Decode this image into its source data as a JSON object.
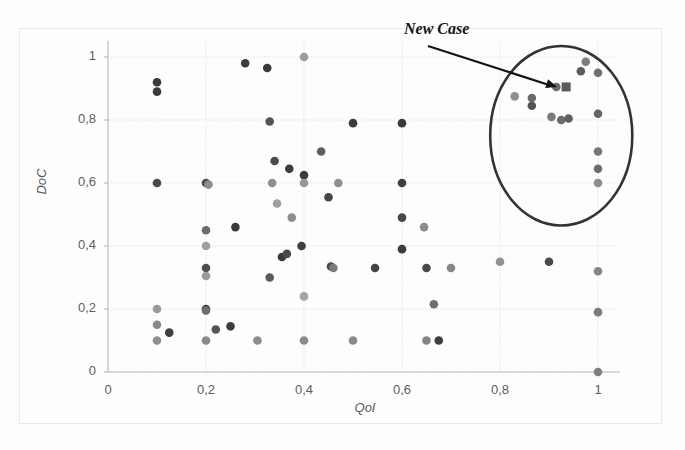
{
  "chart_data": {
    "type": "scatter",
    "title": "",
    "xlabel": "QoI",
    "ylabel": "DoC",
    "xlim": [
      0,
      1.05
    ],
    "ylim": [
      0,
      1.05
    ],
    "grid": true,
    "legend": "none",
    "xtick_labels": [
      "0",
      "0,2",
      "0,4",
      "0,6",
      "0,8",
      "1"
    ],
    "xtick_values": [
      0,
      0.2,
      0.4,
      0.6,
      0.8,
      1
    ],
    "ytick_labels": [
      "0",
      "0,2",
      "0,4",
      "0,6",
      "0,8",
      "1"
    ],
    "ytick_values": [
      0,
      0.2,
      0.4,
      0.6,
      0.8,
      1
    ],
    "series": [
      {
        "name": "past cases",
        "marker": "circle",
        "points": [
          {
            "x": 0.1,
            "y": 0.92,
            "shade": "#3a3a3a"
          },
          {
            "x": 0.1,
            "y": 0.89,
            "shade": "#3a3a3a"
          },
          {
            "x": 0.1,
            "y": 0.6,
            "shade": "#4a4a4a"
          },
          {
            "x": 0.1,
            "y": 0.2,
            "shade": "#9a9a9a"
          },
          {
            "x": 0.1,
            "y": 0.15,
            "shade": "#8a8a8a"
          },
          {
            "x": 0.1,
            "y": 0.1,
            "shade": "#8f8f8f"
          },
          {
            "x": 0.125,
            "y": 0.125,
            "shade": "#3f3f3f"
          },
          {
            "x": 0.2,
            "y": 0.6,
            "shade": "#4c4c4c"
          },
          {
            "x": 0.205,
            "y": 0.595,
            "shade": "#8d8d8d"
          },
          {
            "x": 0.2,
            "y": 0.45,
            "shade": "#6d6d6d"
          },
          {
            "x": 0.2,
            "y": 0.4,
            "shade": "#9e9e9e"
          },
          {
            "x": 0.2,
            "y": 0.33,
            "shade": "#4f4f4f"
          },
          {
            "x": 0.2,
            "y": 0.305,
            "shade": "#9b9b9b"
          },
          {
            "x": 0.2,
            "y": 0.2,
            "shade": "#3c3c3c"
          },
          {
            "x": 0.2,
            "y": 0.195,
            "shade": "#6e6e6e"
          },
          {
            "x": 0.2,
            "y": 0.1,
            "shade": "#8a8a8a"
          },
          {
            "x": 0.22,
            "y": 0.135,
            "shade": "#545454"
          },
          {
            "x": 0.25,
            "y": 0.145,
            "shade": "#3d3d3d"
          },
          {
            "x": 0.26,
            "y": 0.46,
            "shade": "#3a3a3a"
          },
          {
            "x": 0.28,
            "y": 0.98,
            "shade": "#3c3c3c"
          },
          {
            "x": 0.305,
            "y": 0.1,
            "shade": "#8c8c8c"
          },
          {
            "x": 0.325,
            "y": 0.965,
            "shade": "#3a3a3a"
          },
          {
            "x": 0.33,
            "y": 0.3,
            "shade": "#5a5a5a"
          },
          {
            "x": 0.33,
            "y": 0.795,
            "shade": "#545454"
          },
          {
            "x": 0.335,
            "y": 0.6,
            "shade": "#8f8f8f"
          },
          {
            "x": 0.34,
            "y": 0.67,
            "shade": "#4a4a4a"
          },
          {
            "x": 0.345,
            "y": 0.535,
            "shade": "#a0a0a0"
          },
          {
            "x": 0.355,
            "y": 0.365,
            "shade": "#3a3a3a"
          },
          {
            "x": 0.365,
            "y": 0.375,
            "shade": "#4b4b4b"
          },
          {
            "x": 0.37,
            "y": 0.645,
            "shade": "#3c3c3c"
          },
          {
            "x": 0.375,
            "y": 0.49,
            "shade": "#8e8e8e"
          },
          {
            "x": 0.395,
            "y": 0.4,
            "shade": "#3f3f3f"
          },
          {
            "x": 0.4,
            "y": 1.0,
            "shade": "#9c9c9c"
          },
          {
            "x": 0.4,
            "y": 0.625,
            "shade": "#3e3e3e"
          },
          {
            "x": 0.4,
            "y": 0.6,
            "shade": "#989898"
          },
          {
            "x": 0.4,
            "y": 0.1,
            "shade": "#8b8b8b"
          },
          {
            "x": 0.4,
            "y": 0.24,
            "shade": "#a3a3a3"
          },
          {
            "x": 0.435,
            "y": 0.7,
            "shade": "#5e5e5e"
          },
          {
            "x": 0.45,
            "y": 0.555,
            "shade": "#464646"
          },
          {
            "x": 0.455,
            "y": 0.335,
            "shade": "#4a4a4a"
          },
          {
            "x": 0.46,
            "y": 0.33,
            "shade": "#7b7b7b"
          },
          {
            "x": 0.47,
            "y": 0.6,
            "shade": "#8f8f8f"
          },
          {
            "x": 0.5,
            "y": 0.79,
            "shade": "#3b3b3b"
          },
          {
            "x": 0.5,
            "y": 0.1,
            "shade": "#8a8a8a"
          },
          {
            "x": 0.545,
            "y": 0.33,
            "shade": "#454545"
          },
          {
            "x": 0.6,
            "y": 0.79,
            "shade": "#3a3a3a"
          },
          {
            "x": 0.6,
            "y": 0.6,
            "shade": "#3e3e3e"
          },
          {
            "x": 0.6,
            "y": 0.49,
            "shade": "#474747"
          },
          {
            "x": 0.6,
            "y": 0.39,
            "shade": "#3c3c3c"
          },
          {
            "x": 0.645,
            "y": 0.46,
            "shade": "#8d8d8d"
          },
          {
            "x": 0.65,
            "y": 0.33,
            "shade": "#474747"
          },
          {
            "x": 0.65,
            "y": 0.1,
            "shade": "#848484"
          },
          {
            "x": 0.665,
            "y": 0.215,
            "shade": "#6f6f6f"
          },
          {
            "x": 0.675,
            "y": 0.1,
            "shade": "#3d3d3d"
          },
          {
            "x": 0.7,
            "y": 0.33,
            "shade": "#878787"
          },
          {
            "x": 0.8,
            "y": 0.35,
            "shade": "#919191"
          },
          {
            "x": 0.83,
            "y": 0.875,
            "shade": "#8f8f8f"
          },
          {
            "x": 0.865,
            "y": 0.845,
            "shade": "#555555"
          },
          {
            "x": 0.865,
            "y": 0.87,
            "shade": "#6a6a6a"
          },
          {
            "x": 0.9,
            "y": 0.35,
            "shade": "#4a4a4a"
          },
          {
            "x": 0.915,
            "y": 0.905,
            "shade": "#6b6b6b"
          },
          {
            "x": 0.905,
            "y": 0.81,
            "shade": "#7a7a7a"
          },
          {
            "x": 0.925,
            "y": 0.8,
            "shade": "#6b6b6b"
          },
          {
            "x": 0.94,
            "y": 0.805,
            "shade": "#5f5f5f"
          },
          {
            "x": 0.965,
            "y": 0.955,
            "shade": "#5b5b5b"
          },
          {
            "x": 0.975,
            "y": 0.985,
            "shade": "#7d7d7d"
          },
          {
            "x": 1.0,
            "y": 0.95,
            "shade": "#6f6f6f"
          },
          {
            "x": 1.0,
            "y": 0.82,
            "shade": "#656565"
          },
          {
            "x": 1.0,
            "y": 0.7,
            "shade": "#777777"
          },
          {
            "x": 1.0,
            "y": 0.645,
            "shade": "#6d6d6d"
          },
          {
            "x": 1.0,
            "y": 0.6,
            "shade": "#8d8d8d"
          },
          {
            "x": 1.0,
            "y": 0.32,
            "shade": "#868686"
          },
          {
            "x": 1.0,
            "y": 0.19,
            "shade": "#7c7c7c"
          },
          {
            "x": 1.0,
            "y": 0.0,
            "shade": "#7f7f7f"
          }
        ]
      },
      {
        "name": "new case",
        "marker": "square",
        "points": [
          {
            "x": 0.935,
            "y": 0.905,
            "shade": "#5a5a5a"
          }
        ]
      }
    ],
    "annotations": [
      {
        "text": "New Case",
        "target_x": 0.935,
        "target_y": 0.905,
        "style": "arrow"
      }
    ],
    "shapes": [
      {
        "type": "circle",
        "center_x": 0.925,
        "center_y": 0.75,
        "radius_x": 0.145,
        "radius_y": 0.285,
        "stroke": "#333333",
        "description": "cluster-highlight-circle"
      }
    ]
  },
  "axis": {
    "xlabel": "QoI",
    "ylabel": "DoC",
    "xticks": [
      "0",
      "0,2",
      "0,4",
      "0,6",
      "0,8",
      "1"
    ],
    "yticks": [
      "1",
      "0,8",
      "0,6",
      "0,4",
      "0,2",
      "0"
    ]
  },
  "annotation": {
    "new_case_label": "New Case"
  },
  "colors": {
    "grid": "#dcdcdc",
    "axis": "#b9b9b9",
    "text": "#5e5e5e",
    "annotation": "#151515",
    "circle": "#333333"
  }
}
